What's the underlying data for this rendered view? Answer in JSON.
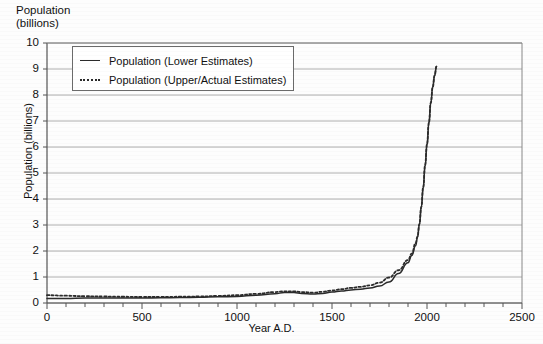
{
  "chart_data": {
    "type": "line",
    "title": "Population\n(billions)",
    "xlabel": "Year A.D.",
    "ylabel": "Population (billions)",
    "xlim": [
      0,
      2500
    ],
    "ylim": [
      0,
      10
    ],
    "xticks": [
      0,
      500,
      1000,
      1500,
      2000,
      2500
    ],
    "xtick_labels": [
      "0",
      "500",
      "1000",
      "1500",
      "2000",
      "2500"
    ],
    "x_minor_tick_step": 100,
    "yticks": [
      0,
      1,
      2,
      3,
      4,
      5,
      6,
      7,
      8,
      9,
      10
    ],
    "ytick_labels": [
      "0",
      "1",
      "2",
      "3",
      "4",
      "5",
      "6",
      "7",
      "8",
      "9",
      "10"
    ],
    "grid": "horizontal",
    "legend_position": "upper-left-inside",
    "series": [
      {
        "name": "Population (Lower Estimates)",
        "style": "solid",
        "color": "#2b2b2b",
        "x": [
          0,
          100,
          200,
          300,
          400,
          500,
          600,
          700,
          800,
          900,
          1000,
          1100,
          1200,
          1250,
          1300,
          1340,
          1400,
          1450,
          1500,
          1550,
          1600,
          1650,
          1700,
          1750,
          1800,
          1850,
          1900,
          1920,
          1940,
          1950,
          1960,
          1970,
          1980,
          1990,
          2000,
          2010,
          2020,
          2030,
          2040,
          2050
        ],
        "values": [
          0.17,
          0.17,
          0.19,
          0.19,
          0.19,
          0.19,
          0.2,
          0.21,
          0.22,
          0.24,
          0.25,
          0.3,
          0.36,
          0.4,
          0.4,
          0.37,
          0.35,
          0.37,
          0.42,
          0.46,
          0.5,
          0.53,
          0.58,
          0.65,
          0.81,
          1.13,
          1.55,
          1.83,
          2.2,
          2.52,
          3.02,
          3.68,
          4.43,
          5.28,
          6.08,
          6.92,
          7.7,
          8.3,
          8.75,
          9.1
        ]
      },
      {
        "name": "Population (Upper/Actual Estimates)",
        "style": "dotted",
        "color": "#2b2b2b",
        "x": [
          0,
          100,
          200,
          300,
          400,
          500,
          600,
          700,
          800,
          900,
          1000,
          1100,
          1200,
          1250,
          1300,
          1340,
          1400,
          1450,
          1500,
          1550,
          1600,
          1650,
          1700,
          1750,
          1800,
          1850,
          1900,
          1920,
          1940,
          1950,
          1960,
          1970,
          1980,
          1990,
          2000,
          2010,
          2020,
          2030,
          2040,
          2050
        ],
        "values": [
          0.3,
          0.28,
          0.26,
          0.25,
          0.24,
          0.23,
          0.23,
          0.24,
          0.25,
          0.27,
          0.3,
          0.35,
          0.42,
          0.45,
          0.45,
          0.42,
          0.4,
          0.43,
          0.48,
          0.53,
          0.58,
          0.62,
          0.68,
          0.78,
          0.98,
          1.26,
          1.65,
          1.9,
          2.3,
          2.56,
          3.04,
          3.7,
          4.45,
          5.3,
          6.1,
          6.93,
          7.7,
          8.3,
          8.75,
          9.1
        ]
      }
    ]
  }
}
